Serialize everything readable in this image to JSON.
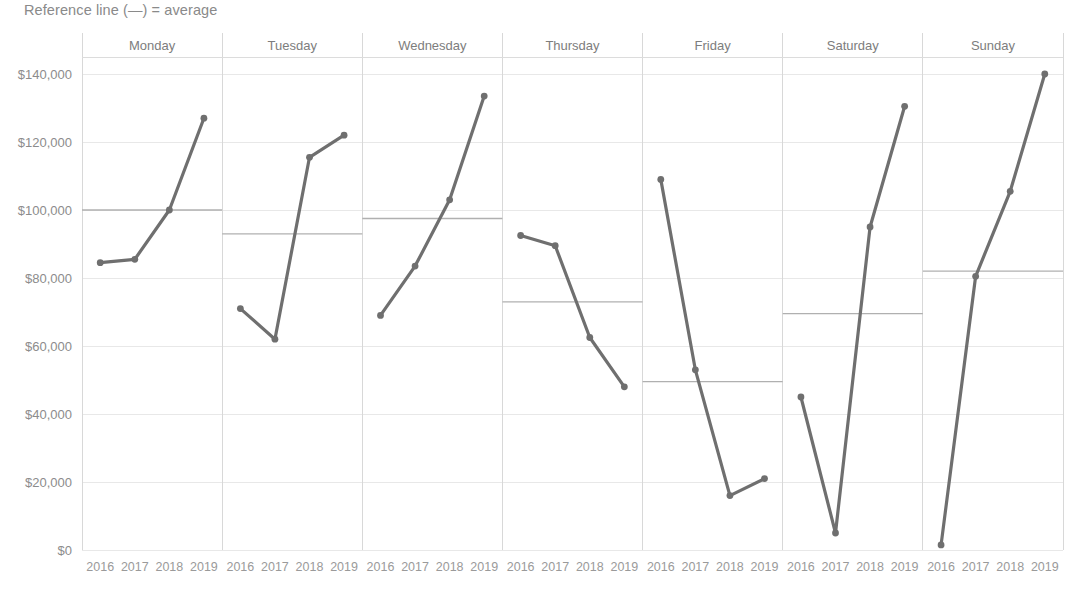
{
  "caption": "Reference line (—) = average",
  "title_partial": "(truncated)",
  "chart_data": {
    "type": "line",
    "title": "",
    "subtitle": "Reference line (—) = average",
    "xlabel": "",
    "ylabel": "",
    "ylim": [
      0,
      145000
    ],
    "grid": true,
    "legend_position": "none",
    "small_multiples": true,
    "panel_order": [
      "Monday",
      "Tuesday",
      "Wednesday",
      "Thursday",
      "Friday",
      "Saturday",
      "Sunday"
    ],
    "x": [
      "2016",
      "2017",
      "2018",
      "2019"
    ],
    "ytick_labels": [
      "$140,000",
      "$120,000",
      "$100,000",
      "$80,000",
      "$60,000",
      "$40,000",
      "$20,000",
      "$0"
    ],
    "ytick_values": [
      140000,
      120000,
      100000,
      80000,
      60000,
      40000,
      20000,
      0
    ],
    "panels": [
      {
        "name": "Monday",
        "values": [
          84500,
          85500,
          100000,
          127000
        ],
        "reference_line": 100000,
        "reference_label": "average"
      },
      {
        "name": "Tuesday",
        "values": [
          71000,
          62000,
          115500,
          122000
        ],
        "reference_line": 93000,
        "reference_label": "average"
      },
      {
        "name": "Wednesday",
        "values": [
          69000,
          83500,
          103000,
          133500
        ],
        "reference_line": 97500,
        "reference_label": "average"
      },
      {
        "name": "Thursday",
        "values": [
          92500,
          89500,
          62500,
          48000
        ],
        "reference_line": 73000,
        "reference_label": "average"
      },
      {
        "name": "Friday",
        "values": [
          109000,
          53000,
          16000,
          21000
        ],
        "reference_line": 49500,
        "reference_label": "average"
      },
      {
        "name": "Saturday",
        "values": [
          45000,
          5000,
          95000,
          130500
        ],
        "reference_line": 69500,
        "reference_label": "average"
      },
      {
        "name": "Sunday",
        "values": [
          1500,
          80500,
          105500,
          140000
        ],
        "reference_line": 82000,
        "reference_label": "average"
      }
    ],
    "colors": {
      "line": "#6f6f6f",
      "reference_line": "#b0b0b0",
      "gridline": "#e8e8e8",
      "text": "#8c8c8c",
      "background": "#ffffff"
    }
  }
}
